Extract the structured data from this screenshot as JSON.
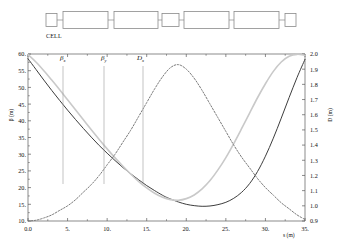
{
  "lattice": {
    "caption": "CELL",
    "elements": [
      {
        "name": "quad-1",
        "x": 46,
        "w": 11,
        "h": 13
      },
      {
        "name": "bend-1",
        "x": 63,
        "w": 45,
        "h": 17
      },
      {
        "name": "bend-2",
        "x": 114,
        "w": 44,
        "h": 17
      },
      {
        "name": "quad-2",
        "x": 162,
        "w": 17,
        "h": 13
      },
      {
        "name": "bend-3",
        "x": 184,
        "w": 45,
        "h": 17
      },
      {
        "name": "bend-4",
        "x": 234,
        "w": 45,
        "h": 17
      },
      {
        "name": "quad-3",
        "x": 285,
        "w": 11,
        "h": 13
      }
    ]
  },
  "axes": {
    "y_left_label": "β (m)",
    "y_right_label": "D (m)",
    "x_label": "s (m)",
    "y_left_ticks": [
      "60.",
      "55.",
      "50.",
      "45.",
      "40.",
      "35.",
      "30.",
      "25.",
      "20.",
      "15.",
      "10."
    ],
    "y_right_ticks": [
      "2.0",
      "1.9",
      "1.8",
      "1.7",
      "1.6",
      "1.5",
      "1.4",
      "1.3",
      "1.2",
      "1.1",
      "1.0",
      "0.9"
    ],
    "x_ticks": [
      "0.0",
      "5.",
      "10.",
      "15.",
      "20.",
      "25.",
      "30.",
      "35."
    ]
  },
  "annotations": [
    {
      "name": "beta-x-label",
      "base": "β",
      "sub": "x",
      "x": 60,
      "y": 10,
      "line_x": 63,
      "line_y1": 22,
      "line_y2": 140
    },
    {
      "name": "beta-y-label",
      "base": "β",
      "sub": "y",
      "x": 101,
      "y": 10,
      "line_x": 104,
      "line_y1": 22,
      "line_y2": 140
    },
    {
      "name": "dispersion-x-label",
      "base": "D",
      "sub": "x",
      "x": 137,
      "y": 10,
      "line_x": 143,
      "line_y1": 22,
      "line_y2": 140
    }
  ],
  "colors": {
    "beta_x": "#3d3d3d",
    "beta_y": "#c9c9c9",
    "dispersion": "#7a7a7a",
    "axis": "#5a5a5a",
    "lattice_stroke": "#8a8a8a"
  },
  "chart_data": {
    "type": "line",
    "title": "",
    "xlabel": "s (m)",
    "ylabel": "β (m)",
    "y2label": "D (m)",
    "xlim": [
      0,
      35
    ],
    "ylim": [
      10,
      60
    ],
    "y2lim": [
      0.9,
      2.0
    ],
    "grid": false,
    "legend": "annotations-in-plot",
    "series": [
      {
        "name": "β_x",
        "axis": "left",
        "style": "solid",
        "color": "#3d3d3d",
        "x": [
          0,
          1,
          2,
          3,
          4,
          5,
          6,
          7,
          8,
          9,
          10,
          11,
          12,
          13,
          14,
          15,
          16,
          17,
          17.5,
          18,
          19,
          20,
          21,
          22,
          23,
          24,
          25,
          26,
          27,
          28,
          29,
          30,
          31,
          32,
          33,
          34,
          35
        ],
        "y": [
          58.6,
          55.4,
          52.2,
          49.1,
          46.1,
          43.2,
          40.4,
          37.7,
          35.1,
          32.6,
          30.3,
          28.1,
          26.0,
          24.1,
          22.3,
          20.6,
          19.1,
          17.7,
          17.1,
          16.6,
          15.7,
          15.0,
          14.6,
          14.4,
          14.5,
          14.9,
          15.6,
          16.8,
          18.6,
          21.2,
          24.8,
          29.4,
          34.8,
          40.8,
          47.0,
          53.0,
          58.4
        ]
      },
      {
        "name": "β_y",
        "axis": "left",
        "style": "solid",
        "color": "#c9c9c9",
        "x": [
          0,
          1,
          2,
          3,
          4,
          5,
          6,
          7,
          8,
          9,
          10,
          11,
          12,
          13,
          14,
          15,
          16,
          17,
          18,
          19,
          20,
          21,
          22,
          23,
          24,
          25,
          26,
          27,
          28,
          29,
          30,
          31,
          32,
          33,
          34,
          35
        ],
        "y": [
          59.8,
          57.6,
          55.0,
          52.2,
          49.3,
          46.3,
          43.3,
          40.3,
          37.3,
          34.4,
          31.6,
          28.9,
          26.4,
          24.0,
          21.8,
          19.9,
          18.3,
          17.1,
          16.4,
          16.2,
          16.7,
          17.8,
          19.6,
          22.1,
          25.3,
          29.0,
          33.2,
          37.7,
          42.3,
          46.9,
          51.1,
          54.8,
          57.6,
          59.3,
          59.9,
          59.6
        ]
      },
      {
        "name": "D_x",
        "axis": "right",
        "style": "dashed",
        "color": "#7a7a7a",
        "x": [
          0,
          1,
          2,
          3,
          4,
          5,
          6,
          7,
          8,
          9,
          10,
          11,
          12,
          13,
          14,
          15,
          16,
          17,
          18,
          19,
          20,
          21,
          22,
          23,
          24,
          25,
          26,
          27,
          28,
          29,
          30,
          31,
          32,
          33,
          34,
          35
        ],
        "y": [
          0.9,
          0.905,
          0.92,
          0.94,
          0.97,
          1.0,
          1.04,
          1.09,
          1.14,
          1.2,
          1.27,
          1.34,
          1.42,
          1.5,
          1.59,
          1.68,
          1.77,
          1.85,
          1.91,
          1.93,
          1.9,
          1.84,
          1.76,
          1.67,
          1.58,
          1.49,
          1.4,
          1.32,
          1.25,
          1.18,
          1.12,
          1.07,
          1.02,
          0.98,
          0.94,
          0.91
        ]
      }
    ]
  }
}
